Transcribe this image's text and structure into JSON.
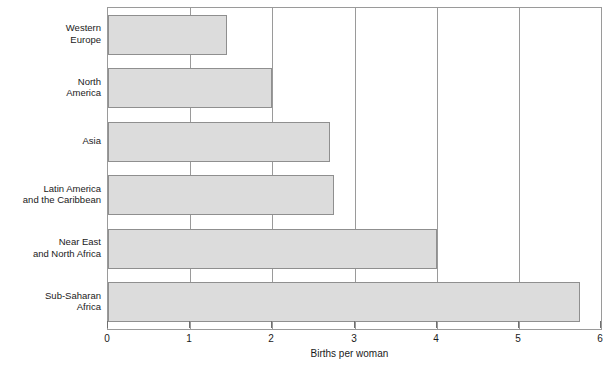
{
  "chart_data": {
    "type": "bar",
    "orientation": "horizontal",
    "title": "",
    "subtitle": "",
    "xlabel": "Births per woman",
    "ylabel": "",
    "xlim": [
      0,
      6
    ],
    "ylim": null,
    "grid": true,
    "legend": null,
    "xticks": [
      "0",
      "1",
      "2",
      "3",
      "4",
      "5",
      "6"
    ],
    "xtick_values": [
      0,
      1,
      2,
      3,
      4,
      5,
      6
    ],
    "categories": [
      "Western\nEurope",
      "North\nAmerica",
      "Asia",
      "Latin America\nand the Caribbean",
      "Near East\nand North Africa",
      "Sub-Saharan\nAfrica"
    ],
    "values": [
      1.45,
      2.0,
      2.7,
      2.75,
      4.0,
      5.75
    ],
    "bar_fill_color": "#dcdcdc",
    "bar_edge_color": "#8f8f8f",
    "frame_color": "#9a9a9a",
    "text_color": "#1a1a1a"
  }
}
